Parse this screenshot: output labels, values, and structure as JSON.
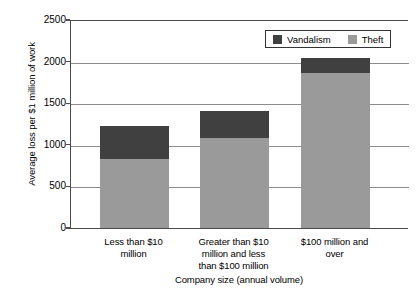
{
  "chart_data": {
    "type": "bar",
    "subtype": "stacked-vertical",
    "title": "",
    "xlabel": "Company size (annual volume)",
    "ylabel": "Average loss per $1 million of work",
    "categories": [
      "Less than $10 million",
      "Greater than $10 million and less than $100 million",
      "$100 million and over"
    ],
    "category_label_lines": [
      [
        "Less than $10",
        "million"
      ],
      [
        "Greater than $10",
        "million and less",
        "than $100 million"
      ],
      [
        "$100 million and",
        "over"
      ]
    ],
    "series": [
      {
        "name": "Theft",
        "color": "#9a9a9a",
        "values": [
          830,
          1080,
          1860
        ]
      },
      {
        "name": "Vandalism",
        "color": "#404040",
        "values": [
          400,
          330,
          180
        ]
      }
    ],
    "stack_totals": [
      1230,
      1410,
      2040
    ],
    "ylim": [
      0,
      2500
    ],
    "yticks": [
      0,
      500,
      1000,
      1500,
      2000,
      2500
    ],
    "ytick_labels": [
      "0",
      "500",
      "1000",
      "1500",
      "2000",
      "2500"
    ],
    "grid": "horizontal",
    "legend": {
      "position": "top-right-inside",
      "entries": [
        {
          "label": "Vandalism",
          "color": "#404040"
        },
        {
          "label": "Theft",
          "color": "#9a9a9a"
        }
      ]
    },
    "axis_color": "#4d4d4d",
    "grid_color": "#8c8c8c",
    "background": "#ffffff"
  }
}
